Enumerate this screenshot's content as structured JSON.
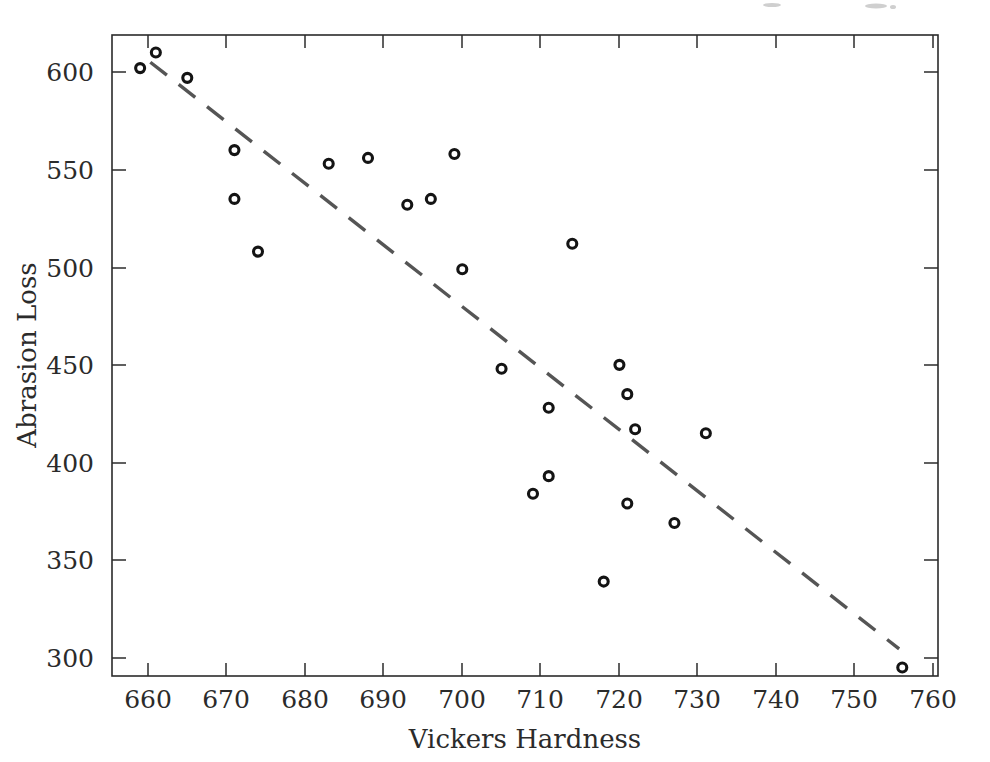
{
  "figure": {
    "background": "#ffffff",
    "width": 990,
    "height": 762
  },
  "axes": {
    "x_title": "Vickers Hardness",
    "y_title": "Abrasion Loss",
    "x_ticks": [
      "660",
      "670",
      "680",
      "690",
      "700",
      "710",
      "720",
      "730",
      "740",
      "750",
      "760"
    ],
    "y_ticks": [
      "300",
      "350",
      "400",
      "450",
      "500",
      "550",
      "600"
    ],
    "frame_color": "#2b2b2b",
    "tick_color": "#2b2b2b"
  },
  "chart_data": {
    "type": "scatter",
    "title": "",
    "subtitle": "",
    "xlabel": "Vickers Hardness",
    "ylabel": "Abrasion Loss",
    "xlim": [
      655,
      762
    ],
    "ylim": [
      286,
      622
    ],
    "xticks": [
      660,
      670,
      680,
      690,
      700,
      710,
      720,
      730,
      740,
      750,
      760
    ],
    "yticks": [
      300,
      350,
      400,
      450,
      500,
      550,
      600
    ],
    "grid": false,
    "legend": null,
    "marker": {
      "shape": "circle-open",
      "color": "#141414",
      "size": 9
    },
    "points": [
      {
        "x": 659,
        "y": 602
      },
      {
        "x": 661,
        "y": 610
      },
      {
        "x": 665,
        "y": 597
      },
      {
        "x": 671,
        "y": 560
      },
      {
        "x": 671,
        "y": 535
      },
      {
        "x": 674,
        "y": 508
      },
      {
        "x": 683,
        "y": 553
      },
      {
        "x": 688,
        "y": 556
      },
      {
        "x": 693,
        "y": 532
      },
      {
        "x": 696,
        "y": 535
      },
      {
        "x": 699,
        "y": 558
      },
      {
        "x": 700,
        "y": 499
      },
      {
        "x": 705,
        "y": 448
      },
      {
        "x": 709,
        "y": 384
      },
      {
        "x": 711,
        "y": 428
      },
      {
        "x": 711,
        "y": 393
      },
      {
        "x": 714,
        "y": 512
      },
      {
        "x": 718,
        "y": 339
      },
      {
        "x": 720,
        "y": 450
      },
      {
        "x": 721,
        "y": 435
      },
      {
        "x": 721,
        "y": 379
      },
      {
        "x": 722,
        "y": 417
      },
      {
        "x": 727,
        "y": 369
      },
      {
        "x": 731,
        "y": 415
      },
      {
        "x": 756,
        "y": 295
      }
    ],
    "fit_line": {
      "style": "dashed",
      "color": "#555555",
      "x0": 660.3,
      "y0": 605.0,
      "x1": 755.6,
      "y1": 304.5
    }
  }
}
